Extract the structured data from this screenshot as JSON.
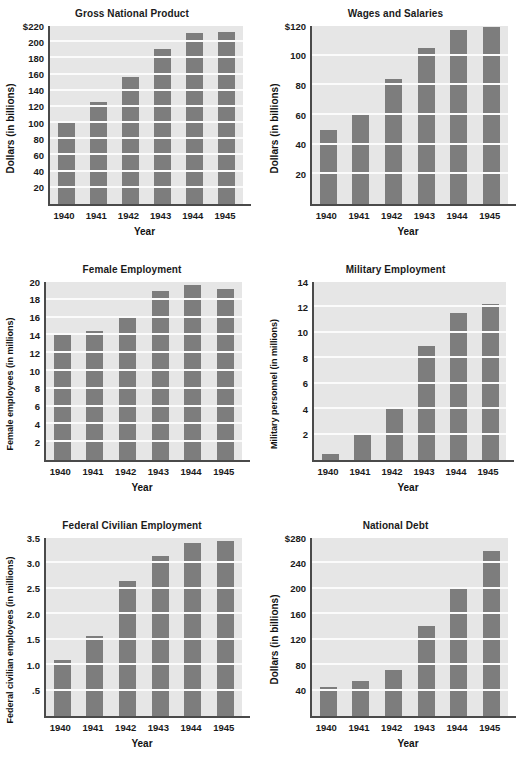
{
  "page": {
    "background": "#ffffff",
    "bar_color": "#7d7d7d",
    "plot_background": "#e6e6e6",
    "gridline_color": "#fbfbfb",
    "axis_color": "#4a4a4a"
  },
  "chart_data": [
    {
      "type": "bar",
      "title": "Gross National Product",
      "xlabel": "Year",
      "ylabel": "Dollars (in billions)",
      "categories": [
        "1940",
        "1941",
        "1942",
        "1943",
        "1944",
        "1945"
      ],
      "values": [
        100,
        126,
        157,
        192,
        211,
        213
      ],
      "ylim": [
        0,
        220
      ],
      "yticks": [
        20,
        40,
        60,
        80,
        100,
        120,
        140,
        160,
        180,
        200,
        220
      ],
      "ytick_labels": [
        "20",
        "40",
        "60",
        "80",
        "100",
        "120",
        "140",
        "160",
        "180",
        "200",
        "$220"
      ],
      "grid": true,
      "legend": "none"
    },
    {
      "type": "bar",
      "title": "Wages and Salaries",
      "xlabel": "Year",
      "ylabel": "Dollars (in billions)",
      "categories": [
        "1940",
        "1941",
        "1942",
        "1943",
        "1944",
        "1945"
      ],
      "values": [
        50,
        61,
        84,
        105,
        117,
        119
      ],
      "ylim": [
        0,
        120
      ],
      "yticks": [
        20,
        40,
        60,
        80,
        100,
        120
      ],
      "ytick_labels": [
        "20",
        "40",
        "60",
        "80",
        "100",
        "$120"
      ],
      "grid": true,
      "legend": "none"
    },
    {
      "type": "bar",
      "title": "Female Employment",
      "xlabel": "Year",
      "ylabel": "Female employees (in millions)",
      "categories": [
        "1940",
        "1941",
        "1942",
        "1943",
        "1944",
        "1945"
      ],
      "values": [
        14.1,
        14.5,
        16.0,
        19.0,
        19.7,
        19.2
      ],
      "ylim": [
        0,
        20
      ],
      "yticks": [
        2,
        4,
        6,
        8,
        10,
        12,
        14,
        16,
        18,
        20
      ],
      "ytick_labels": [
        "2",
        "4",
        "6",
        "8",
        "10",
        "12",
        "14",
        "16",
        "18",
        "20"
      ],
      "grid": true,
      "legend": "none"
    },
    {
      "type": "bar",
      "title": "Military Employment",
      "xlabel": "Year",
      "ylabel": "Military personnel (in millions)",
      "categories": [
        "1940",
        "1941",
        "1942",
        "1943",
        "1944",
        "1945"
      ],
      "values": [
        0.5,
        2.0,
        4.0,
        9.0,
        11.6,
        12.3
      ],
      "ylim": [
        0,
        14
      ],
      "yticks": [
        2,
        4,
        6,
        8,
        10,
        12,
        14
      ],
      "ytick_labels": [
        "2",
        "4",
        "6",
        "8",
        "10",
        "12",
        "14"
      ],
      "grid": true,
      "legend": "none"
    },
    {
      "type": "bar",
      "title": "Federal Civilian Employment",
      "xlabel": "Year",
      "ylabel": "Federal civilian employees (in millions)",
      "categories": [
        "1940",
        "1941",
        "1942",
        "1943",
        "1944",
        "1945"
      ],
      "values": [
        1.1,
        1.58,
        2.65,
        3.15,
        3.4,
        3.45
      ],
      "ylim": [
        0,
        3.5
      ],
      "yticks": [
        0.5,
        1.0,
        1.5,
        2.0,
        2.5,
        3.0,
        3.5
      ],
      "ytick_labels": [
        ".5",
        "1.0",
        "1.5",
        "2.0",
        "2.5",
        "3.0",
        "3.5"
      ],
      "grid": true,
      "legend": "none"
    },
    {
      "type": "bar",
      "title": "National Debt",
      "xlabel": "Year",
      "ylabel": "Dollars (in billions)",
      "categories": [
        "1940",
        "1941",
        "1942",
        "1943",
        "1944",
        "1945"
      ],
      "values": [
        45,
        55,
        73,
        142,
        201,
        260
      ],
      "ylim": [
        0,
        280
      ],
      "yticks": [
        40,
        80,
        120,
        160,
        200,
        240,
        280
      ],
      "ytick_labels": [
        "40",
        "80",
        "120",
        "160",
        "200",
        "240",
        "$280"
      ],
      "grid": true,
      "legend": "none"
    }
  ]
}
